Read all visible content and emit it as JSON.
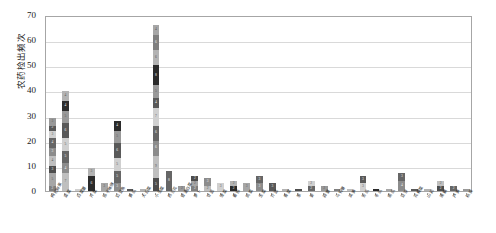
{
  "chart_data": {
    "type": "bar",
    "stacked": true,
    "title": "",
    "xlabel": "",
    "ylabel": "农药检出频次",
    "ylim": [
      0,
      70
    ],
    "yticks": [
      0,
      10,
      20,
      30,
      40,
      50,
      60,
      70
    ],
    "grid": true,
    "legend": "none",
    "categories": [
      "枸杞鲜果",
      "韭菜",
      "白菜薹",
      "芹菜",
      "茄子辣椒",
      "豇豆角",
      "黄瓜",
      "大白菜",
      "小油菜",
      "西兰花",
      "普通白菜",
      "萝卜",
      "甘蓝",
      "菠菜",
      "番茄",
      "茼蒿",
      "生菜",
      "芥蓝",
      "香菜",
      "葱",
      "姜",
      "蒜薹",
      "马铃薯",
      "莴笋",
      "苦瓜",
      "冬瓜",
      "南瓜",
      "豆芽",
      "花椰菜",
      "山药",
      "莲藕",
      "芦笋",
      "秋葵"
    ],
    "totals": [
      29,
      40,
      1,
      9,
      3,
      28,
      1,
      1,
      66,
      8,
      2,
      6,
      5,
      3,
      4,
      3,
      6,
      3,
      1,
      1,
      4,
      2,
      1,
      1,
      6,
      1,
      1,
      7,
      1,
      1,
      4,
      2,
      1
    ],
    "stacks": [
      [
        2,
        5,
        3,
        4,
        3,
        4,
        3,
        2,
        3
      ],
      [
        7,
        4,
        5,
        5,
        6,
        5,
        4,
        4
      ],
      [
        1
      ],
      [
        6,
        3
      ],
      [
        3
      ],
      [
        3,
        5,
        5,
        6,
        5,
        4
      ],
      [
        1
      ],
      [
        1
      ],
      [
        5,
        9,
        6,
        6,
        7,
        4,
        5,
        8,
        6,
        6,
        4
      ],
      [
        8
      ],
      [
        2
      ],
      [
        2,
        2,
        2
      ],
      [
        2,
        3
      ],
      [
        3
      ],
      [
        2,
        2
      ],
      [
        3
      ],
      [
        3,
        3
      ],
      [
        3
      ],
      [
        1
      ],
      [
        1
      ],
      [
        2,
        2
      ],
      [
        2
      ],
      [
        1
      ],
      [
        1
      ],
      [
        3,
        3
      ],
      [
        1
      ],
      [
        1
      ],
      [
        4,
        3
      ],
      [
        1
      ],
      [
        1
      ],
      [
        2,
        2
      ],
      [
        2
      ],
      [
        1
      ]
    ],
    "palette": [
      "#7f7f7f",
      "#a6a6a6",
      "#4d4d4d",
      "#bfbfbf",
      "#8c8c8c",
      "#666666",
      "#d0d0d0",
      "#595959",
      "#999999",
      "#2b2b2b",
      "#b3b3b3"
    ]
  }
}
